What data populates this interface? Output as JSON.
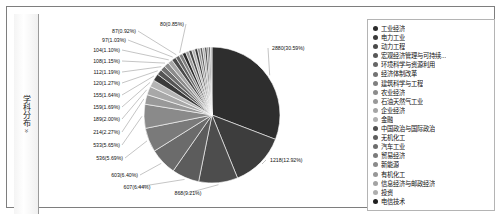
{
  "panel": {
    "side_tab": {
      "label": "学科分布",
      "chevron": "»"
    }
  },
  "legend": {
    "items": [
      {
        "label": "工业经济",
        "color": "#2b2b2b"
      },
      {
        "label": "电力工业",
        "color": "#3a3a3a"
      },
      {
        "label": "动力工程",
        "color": "#4a4a4a"
      },
      {
        "label": "宏观经济管理与可持续...",
        "color": "#585858"
      },
      {
        "label": "环境科学与资源利用",
        "color": "#666666"
      },
      {
        "label": "经济体制改革",
        "color": "#737373"
      },
      {
        "label": "建筑科学与工程",
        "color": "#808080"
      },
      {
        "label": "农业经济",
        "color": "#8c8c8c"
      },
      {
        "label": "石油天然气工业",
        "color": "#999999"
      },
      {
        "label": "企业经济",
        "color": "#a5a5a5"
      },
      {
        "label": "金融",
        "color": "#b0b0b0"
      },
      {
        "label": "中国政治与国际政治",
        "color": "#4f4f4f"
      },
      {
        "label": "无机化工",
        "color": "#5e5e5e"
      },
      {
        "label": "汽车工业",
        "color": "#6d6d6d"
      },
      {
        "label": "贸易经济",
        "color": "#7b7b7b"
      },
      {
        "label": "新能源",
        "color": "#8a8a8a"
      },
      {
        "label": "有机化工",
        "color": "#979797"
      },
      {
        "label": "信息经济与邮政经济",
        "color": "#a3a3a3"
      },
      {
        "label": "投资",
        "color": "#aeaeae"
      },
      {
        "label": "电信技术",
        "color": "#1f1f1f"
      }
    ],
    "pager": {
      "text": "1/2",
      "up_icon": "triangle-up-icon",
      "down_icon": "triangle-down-icon"
    }
  },
  "chart_data": {
    "type": "pie",
    "title": "",
    "legend_position": "right",
    "total": 9415,
    "value_suffix": "",
    "labels_format": "count(percent%)",
    "categories": [
      "工业经济",
      "电力工业",
      "动力工程",
      "宏观经济管理与可持续...",
      "环境科学与资源利用",
      "经济体制改革",
      "建筑科学与工程",
      "农业经济",
      "石油天然气工业",
      "企业经济",
      "金融",
      "中国政治与国际政治",
      "无机化工",
      "汽车工业",
      "贸易经济",
      "新能源",
      "有机化工",
      "信息经济与邮政经济",
      "投资",
      "电信技术"
    ],
    "slices": [
      {
        "label": "2880(30.59%)",
        "value": 2880,
        "percent": 30.59,
        "color": "#2e2e2e"
      },
      {
        "label": "1218(12.92%)",
        "value": 1218,
        "percent": 12.92,
        "color": "#3d3d3d"
      },
      {
        "label": "868(9.21%)",
        "value": 868,
        "percent": 9.21,
        "color": "#4d4d4d"
      },
      {
        "label": "607(6.44%)",
        "value": 607,
        "percent": 6.44,
        "color": "#5c5c5c"
      },
      {
        "label": "603(6.40%)",
        "value": 603,
        "percent": 6.4,
        "color": "#6b6b6b"
      },
      {
        "label": "536(5.69%)",
        "value": 536,
        "percent": 5.69,
        "color": "#7a7a7a"
      },
      {
        "label": "533(5.65%)",
        "value": 533,
        "percent": 5.65,
        "color": "#8a8a8a"
      },
      {
        "label": "214(2.27%)",
        "value": 214,
        "percent": 2.27,
        "color": "#999999"
      },
      {
        "label": "189(2.00%)",
        "value": 189,
        "percent": 2.0,
        "color": "#a8a8a8"
      },
      {
        "label": "159(1.69%)",
        "value": 159,
        "percent": 1.69,
        "color": "#b5b5b5"
      },
      {
        "label": "155(1.64%)",
        "value": 155,
        "percent": 1.64,
        "color": "#3a3a3a"
      },
      {
        "label": "120(1.27%)",
        "value": 120,
        "percent": 1.27,
        "color": "#555555"
      },
      {
        "label": "112(1.19%)",
        "value": 112,
        "percent": 1.19,
        "color": "#707070"
      },
      {
        "label": "108(1.15%)",
        "value": 108,
        "percent": 1.15,
        "color": "#8b8b8b"
      },
      {
        "label": "104(1.10%)",
        "value": 104,
        "percent": 1.1,
        "color": "#a6a6a6"
      },
      {
        "label": "97(1.03%)",
        "value": 97,
        "percent": 1.03,
        "color": "#4a4a4a"
      },
      {
        "label": "87(0.92%)",
        "value": 87,
        "percent": 0.92,
        "color": "#656565"
      },
      {
        "label": "80(0.85%)",
        "value": 80,
        "percent": 0.85,
        "color": "#808080"
      },
      {
        "label": "",
        "value": 78,
        "percent": 0.83,
        "color": "#2a2a2a"
      },
      {
        "label": "",
        "value": 74,
        "percent": 0.79,
        "color": "#9b9b9b"
      },
      {
        "label": "",
        "value": 70,
        "percent": 0.74,
        "color": "#454545"
      },
      {
        "label": "",
        "value": 66,
        "percent": 0.7,
        "color": "#b0b0b0"
      },
      {
        "label": "",
        "value": 62,
        "percent": 0.66,
        "color": "#353535"
      },
      {
        "label": "",
        "value": 58,
        "percent": 0.62,
        "color": "#909090"
      },
      {
        "label": "",
        "value": 54,
        "percent": 0.57,
        "color": "#5a5a5a"
      },
      {
        "label": "",
        "value": 50,
        "percent": 0.53,
        "color": "#a8a8a8"
      },
      {
        "label": "",
        "value": 46,
        "percent": 0.49,
        "color": "#303030"
      },
      {
        "label": "",
        "value": 42,
        "percent": 0.45,
        "color": "#858585"
      },
      {
        "label": "",
        "value": 38,
        "percent": 0.4,
        "color": "#4f4f4f"
      },
      {
        "label": "",
        "value": 34,
        "percent": 0.36,
        "color": "#aaaaaa"
      }
    ]
  }
}
